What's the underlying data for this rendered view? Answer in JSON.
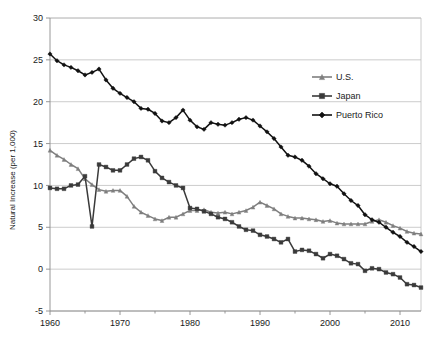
{
  "chart_data": {
    "type": "line",
    "title": "",
    "xlabel": "",
    "ylabel": "Natural Increase (per 1,000)",
    "xlim": [
      1960,
      2013
    ],
    "ylim": [
      -5,
      30
    ],
    "ytick_step": 5,
    "xtick_step": 10,
    "grid": true,
    "grid_axis": "y",
    "legend_position": "upper-right",
    "xticks": [
      "1960",
      "1970",
      "1980",
      "1990",
      "2000",
      "2010"
    ],
    "xtick_values": [
      1960,
      1970,
      1980,
      1990,
      2000,
      2010
    ],
    "yticks": [
      "-5",
      "0",
      "5",
      "10",
      "15",
      "20",
      "25",
      "30"
    ],
    "ytick_values": [
      -5,
      0,
      5,
      10,
      15,
      20,
      25,
      30
    ],
    "x": [
      1960,
      1961,
      1962,
      1963,
      1964,
      1965,
      1966,
      1967,
      1968,
      1969,
      1970,
      1971,
      1972,
      1973,
      1974,
      1975,
      1976,
      1977,
      1978,
      1979,
      1980,
      1981,
      1982,
      1983,
      1984,
      1985,
      1986,
      1987,
      1988,
      1989,
      1990,
      1991,
      1992,
      1993,
      1994,
      1995,
      1996,
      1997,
      1998,
      1999,
      2000,
      2001,
      2002,
      2003,
      2004,
      2005,
      2006,
      2007,
      2008,
      2009,
      2010,
      2011,
      2012,
      2013
    ],
    "series": [
      {
        "name": "U.S.",
        "color": "#7f7f7f",
        "marker": "triangle",
        "values": [
          14.2,
          13.6,
          13.1,
          12.5,
          12.0,
          10.8,
          10.1,
          9.5,
          9.3,
          9.4,
          9.4,
          8.7,
          7.5,
          6.8,
          6.4,
          6.0,
          5.8,
          6.2,
          6.2,
          6.6,
          7.0,
          7.0,
          7.1,
          6.8,
          6.7,
          6.8,
          6.6,
          6.8,
          7.0,
          7.4,
          8.0,
          7.6,
          7.2,
          6.6,
          6.3,
          6.1,
          6.1,
          6.0,
          5.9,
          5.7,
          5.8,
          5.5,
          5.4,
          5.4,
          5.4,
          5.4,
          5.7,
          5.9,
          5.6,
          5.2,
          4.9,
          4.5,
          4.3,
          4.2
        ]
      },
      {
        "name": "Japan",
        "color": "#3a3a3a",
        "marker": "square",
        "values": [
          9.7,
          9.6,
          9.6,
          10.0,
          10.1,
          11.1,
          5.1,
          12.5,
          12.2,
          11.8,
          11.8,
          12.5,
          13.2,
          13.4,
          13.0,
          11.7,
          10.9,
          10.4,
          10.0,
          9.7,
          7.3,
          7.2,
          6.9,
          6.6,
          6.2,
          6.0,
          5.6,
          5.1,
          4.7,
          4.6,
          4.1,
          3.9,
          3.6,
          3.2,
          3.6,
          2.1,
          2.3,
          2.2,
          1.8,
          1.3,
          1.8,
          1.6,
          1.2,
          0.7,
          0.6,
          -0.2,
          0.1,
          0.0,
          -0.4,
          -0.6,
          -1.0,
          -1.8,
          -1.9,
          -2.2
        ]
      },
      {
        "name": "Puerto Rico",
        "color": "#111111",
        "marker": "diamond",
        "values": [
          25.7,
          24.9,
          24.4,
          24.1,
          23.7,
          23.2,
          23.5,
          23.9,
          22.6,
          21.6,
          21.0,
          20.5,
          20.0,
          19.2,
          19.1,
          18.6,
          17.7,
          17.5,
          18.1,
          19.0,
          17.8,
          17.0,
          16.7,
          17.5,
          17.3,
          17.2,
          17.5,
          17.9,
          18.1,
          17.8,
          17.1,
          16.4,
          15.6,
          14.6,
          13.6,
          13.4,
          13.0,
          12.3,
          11.4,
          10.8,
          10.2,
          9.9,
          9.0,
          8.2,
          7.6,
          6.5,
          5.9,
          5.6,
          5.0,
          4.4,
          3.9,
          3.2,
          2.7,
          2.1
        ]
      }
    ]
  },
  "legend": {
    "items": [
      {
        "label": "U.S."
      },
      {
        "label": "Japan"
      },
      {
        "label": "Puerto Rico"
      }
    ]
  }
}
